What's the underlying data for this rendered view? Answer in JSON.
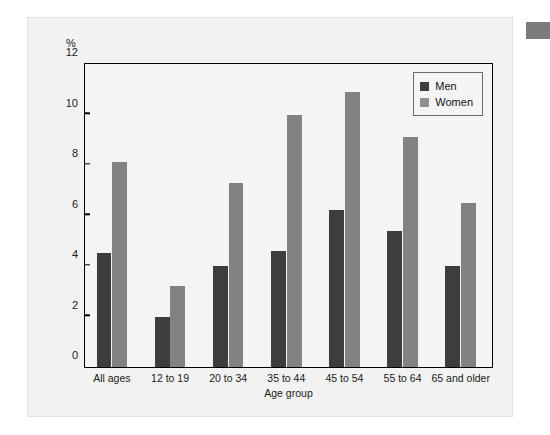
{
  "chart_data": {
    "type": "bar",
    "title": "",
    "xlabel": "Age group",
    "ylabel": "",
    "y_unit": "%",
    "ylim": [
      0,
      12
    ],
    "yticks": [
      0,
      2,
      4,
      6,
      8,
      10,
      12
    ],
    "ytick_labels": [
      "0",
      "2",
      "4",
      "6",
      "8",
      "10",
      "12"
    ],
    "grid": false,
    "legend_position": "top-right",
    "categories": [
      "All ages",
      "12 to 19",
      "20 to 34",
      "35 to 44",
      "45 to 54",
      "55 to 64",
      "65 and older"
    ],
    "series": [
      {
        "name": "Men",
        "color": "#3d3d3d",
        "values": [
          4.5,
          2.0,
          4.0,
          4.6,
          6.2,
          5.4,
          4.0
        ]
      },
      {
        "name": "Women",
        "color": "#828282",
        "values": [
          8.1,
          3.2,
          7.3,
          10.0,
          10.9,
          9.1,
          6.5
        ]
      }
    ]
  },
  "legend": {
    "items": [
      {
        "label": "Men",
        "swatch": "men"
      },
      {
        "label": "Women",
        "swatch": "women"
      }
    ]
  },
  "colors": {
    "men": "#3d3d3d",
    "women": "#828282",
    "card_background": "#f2f2f2",
    "plot_background": "#f4f4f4",
    "axis": "#000000",
    "corner_block": "#7b7b7b"
  }
}
